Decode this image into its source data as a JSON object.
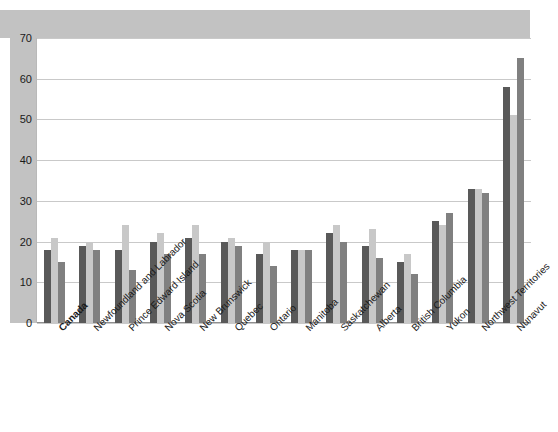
{
  "chart_data": {
    "type": "bar",
    "title": "",
    "xlabel": "",
    "ylabel": "",
    "ylim": [
      0,
      70
    ],
    "yticks": [
      0,
      10,
      20,
      30,
      40,
      50,
      60,
      70
    ],
    "grid": true,
    "legend_position": "top-right",
    "categories": [
      "Canada",
      "Newfoundland and Labrador",
      "Prince Edward Island",
      "Nova Scotia",
      "New Brunswick",
      "Quebec",
      "Ontario",
      "Manitoba",
      "Saskatchewan",
      "Alberta",
      "British Columbia",
      "Yukon",
      "Northwest Territories",
      "Nunavut"
    ],
    "bold_categories": [
      "Canada"
    ],
    "series": [
      {
        "name": "Total",
        "color": "#595959",
        "values": [
          18,
          19,
          18,
          20,
          21,
          20,
          17,
          18,
          22,
          19,
          15,
          25,
          33,
          58
        ]
      },
      {
        "name": "Males",
        "color": "#c8c8c8",
        "values": [
          21,
          20,
          24,
          22,
          24,
          21,
          20,
          18,
          24,
          23,
          17,
          24,
          33,
          51
        ]
      },
      {
        "name": "Females",
        "color": "#808080",
        "values": [
          15,
          18,
          13,
          17,
          17,
          19,
          14,
          18,
          20,
          16,
          12,
          27,
          32,
          65
        ]
      }
    ]
  },
  "frame": {
    "band_color": "#c2c2c2",
    "plot_background": "#ffffff",
    "gridline_color": "#c9c9c9"
  }
}
